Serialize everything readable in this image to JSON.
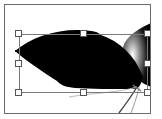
{
  "canvas": {
    "background": "#ffffff",
    "frame_color": "#6a6a6a"
  },
  "shapes": [
    {
      "name": "black-leaf",
      "fill": "#000000",
      "selected": true
    },
    {
      "name": "gradient-petal",
      "fill": "radial-gradient black to grey"
    },
    {
      "name": "stems",
      "stroke": "#555555"
    }
  ],
  "selection": {
    "handles": [
      "top-left",
      "top-center",
      "top-right",
      "middle-left",
      "middle-right",
      "bottom-left",
      "bottom-center",
      "bottom-right"
    ],
    "handle_color": "#ffffff",
    "border_color": "#7a7a7a"
  }
}
